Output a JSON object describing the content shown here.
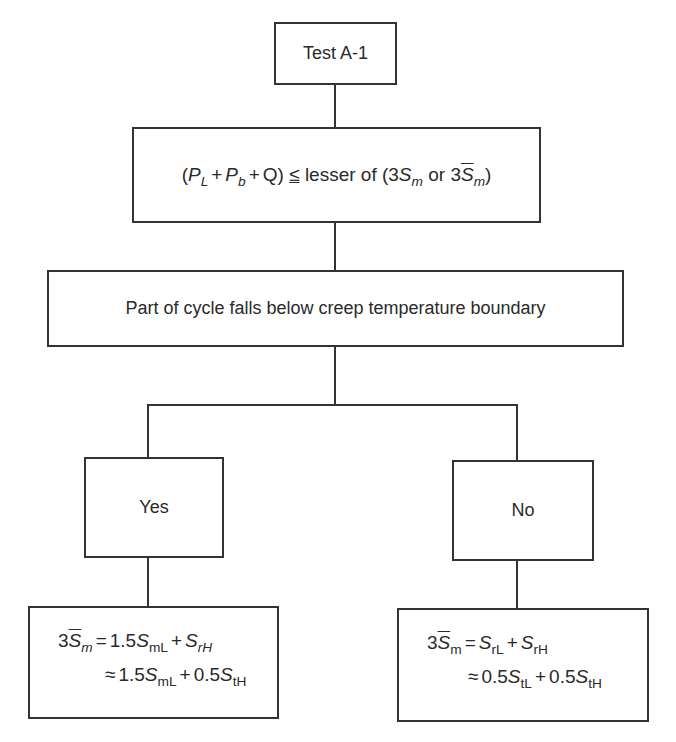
{
  "diagram": {
    "title_box": {
      "label": "Test A-1"
    },
    "condition_box": {
      "parts": {
        "open": "(",
        "p": "P",
        "p_l_sub": "L",
        "plus1": "+",
        "p2": "P",
        "p_b_sub": "b",
        "plus2": "+",
        "q": "Q)",
        "le": "≤",
        "lesser": "lesser of (3",
        "s1": "S",
        "m_sub1": "m",
        "or": " or 3",
        "s2": "S",
        "m_sub2": "m",
        "close": ")"
      },
      "text": "(P_L + P_b + Q) ≤ lesser of (3S_m or 3S̄_m)"
    },
    "question_box": {
      "label": "Part of cycle falls below creep temperature boundary"
    },
    "branches": [
      {
        "label": "Yes"
      },
      {
        "label": "No"
      }
    ],
    "result_yes": {
      "line1": {
        "coef": "3",
        "s": "S",
        "sub": "m",
        "eq": "=",
        "a": "1.5",
        "s_a": "S",
        "sub_a": "mL",
        "plus": "+",
        "s_b": "S",
        "sub_b": "rH"
      },
      "line2": {
        "approx": "≈",
        "a": "1.5",
        "s_a": "S",
        "sub_a": "mL",
        "plus": "+",
        "b": "0.5",
        "s_b": "S",
        "sub_b": "tH"
      },
      "text": "3S̄_m = 1.5S_mL + S_rH ≈ 1.5S_mL + 0.5S_tH"
    },
    "result_no": {
      "line1": {
        "coef": "3",
        "s": "S",
        "sub": "m",
        "eq": "=",
        "s_a": "S",
        "sub_a": "rL",
        "plus": "+",
        "s_b": "S",
        "sub_b": "rH"
      },
      "line2": {
        "approx": "≈",
        "a": "0.5",
        "s_a": "S",
        "sub_a": "tL",
        "plus": "+",
        "b": "0.5",
        "s_b": "S",
        "sub_b": "tH"
      },
      "text": "3S̄_m = S_rL + S_rH ≈ 0.5S_tL + 0.5S_tH"
    },
    "colors": {
      "line": "#333333",
      "text": "#2a2a2a",
      "background": "#ffffff"
    }
  }
}
